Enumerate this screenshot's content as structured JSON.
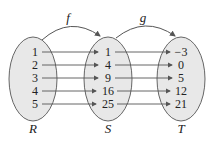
{
  "diagram": {
    "functions": [
      {
        "name": "f",
        "from": "R",
        "to": "S"
      },
      {
        "name": "g",
        "from": "S",
        "to": "T"
      }
    ],
    "sets": [
      {
        "label": "R",
        "elements": [
          "1",
          "2",
          "3",
          "4",
          "5"
        ]
      },
      {
        "label": "S",
        "elements": [
          "1",
          "4",
          "9",
          "16",
          "25"
        ]
      },
      {
        "label": "T",
        "elements": [
          "−3",
          "0",
          "5",
          "12",
          "21"
        ]
      }
    ],
    "colors": {
      "ellipse_fill": "#e8e8e8",
      "stroke": "#555555"
    }
  }
}
